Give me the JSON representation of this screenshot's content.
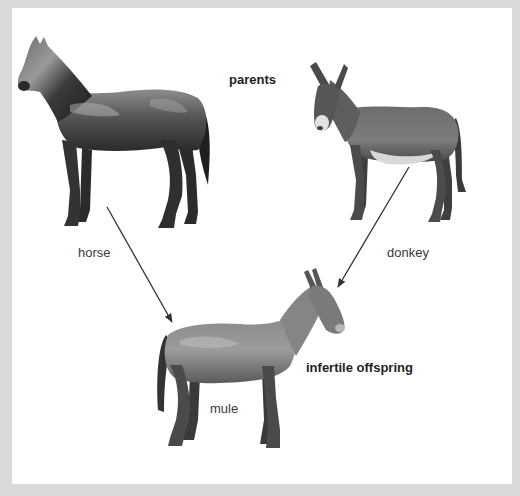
{
  "diagram": {
    "heading": "parents",
    "parents": [
      {
        "id": "horse",
        "label": "horse",
        "icon": "horse-illustration"
      },
      {
        "id": "donkey",
        "label": "donkey",
        "icon": "donkey-illustration"
      }
    ],
    "offspring": {
      "id": "mule",
      "label": "mule",
      "descriptor": "infertile offspring",
      "icon": "mule-illustration"
    },
    "arrows": [
      {
        "from": "horse",
        "to": "mule",
        "start": [
          107,
          207
        ],
        "end": [
          172,
          322
        ]
      },
      {
        "from": "donkey",
        "to": "mule",
        "start": [
          409,
          167
        ],
        "end": [
          338,
          287
        ]
      }
    ],
    "colors": {
      "frame": "#dadada",
      "panel": "#ffffff",
      "arrow": "#333333",
      "label_text": "#3a3a3a",
      "bold_text": "#1f1f1f"
    }
  }
}
